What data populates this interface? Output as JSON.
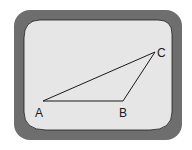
{
  "diagram": {
    "type": "triangle-on-screen",
    "colors": {
      "frame": "#6e6e6e",
      "screen": "#e6e6e6",
      "line": "#1a1a1a",
      "background": "#ffffff"
    },
    "vertices": [
      {
        "label": "A",
        "x": 43,
        "y": 101
      },
      {
        "label": "B",
        "x": 123,
        "y": 101
      },
      {
        "label": "C",
        "x": 155,
        "y": 52
      }
    ],
    "labels": {
      "a": "A",
      "b": "B",
      "c": "C"
    }
  }
}
